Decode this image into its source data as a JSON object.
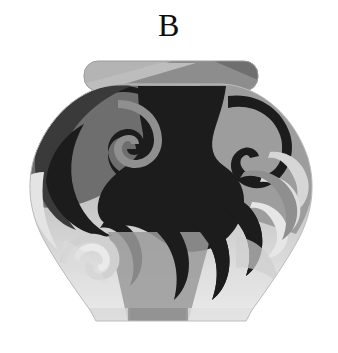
{
  "figure": {
    "panel_label": "B",
    "background_color": "#ffffff",
    "canvas": {
      "width": 338,
      "height": 353
    }
  },
  "palette": {
    "background": "#ffffff",
    "ink_black": "#0d0d0d",
    "motif_darkest": "#1c1c1c",
    "motif_dark": "#3a3a3a",
    "body_mid_dark": "#6e6e6e",
    "body_mid": "#8f8f8f",
    "body_mid_light": "#a8a8a8",
    "body_light": "#c9c9c9",
    "body_lightest": "#e6e6e6",
    "rim_light": "#b4b4b4",
    "rim_mid": "#9a9a9a",
    "rim_dark": "#7d7d7d",
    "rim_darkest": "#636363"
  },
  "vase": {
    "parts": [
      {
        "id": "rim",
        "name": "Rim / lid",
        "shape": "flattened-pill-ellipse",
        "tone": "two-tone diagonal gray split"
      },
      {
        "id": "shoulder",
        "name": "Shoulder",
        "shape": "wide-rounded",
        "tone": "mid gray"
      },
      {
        "id": "body",
        "name": "Body",
        "shape": "bulbous-tapering",
        "tone": "graded gray"
      },
      {
        "id": "base",
        "name": "Flat base",
        "shape": "straight-edge",
        "tone": "light gray"
      }
    ],
    "geometry": {
      "rim_left": 85,
      "rim_right": 256,
      "rim_top": 62,
      "rim_bottom": 90,
      "body_top": 84,
      "body_widest_y": 178,
      "body_left": 31,
      "body_right": 310,
      "base_left": 96,
      "base_right": 246,
      "base_y": 321
    }
  },
  "decoration": {
    "style": "abstract swirl and claw motif",
    "motifs": [
      {
        "id": "spiral-upper-left",
        "name": "Upper-left spiral scroll",
        "tone": "#8f8f8f"
      },
      {
        "id": "spiral-left-large",
        "name": "Large left spiral",
        "tone": "#1c1c1c"
      },
      {
        "id": "central-mass",
        "name": "Central dark hourglass mass",
        "tone": "#1c1c1c"
      },
      {
        "id": "claw-right-upper",
        "name": "Upper-right curled claw",
        "tone": "#1c1c1c"
      },
      {
        "id": "claw-right-nested",
        "name": "Nested right claws",
        "tone": "#c9c9c9"
      },
      {
        "id": "claw-bottom-center",
        "name": "Bottom-center descending claws",
        "tone": "#1c1c1c"
      },
      {
        "id": "spiral-bottom-left",
        "name": "Bottom-left pale spiral",
        "tone": "#d4d4d4"
      },
      {
        "id": "wedge-bottom",
        "name": "Bottom mid-gray wedge",
        "tone": "#8f8f8f"
      }
    ]
  }
}
